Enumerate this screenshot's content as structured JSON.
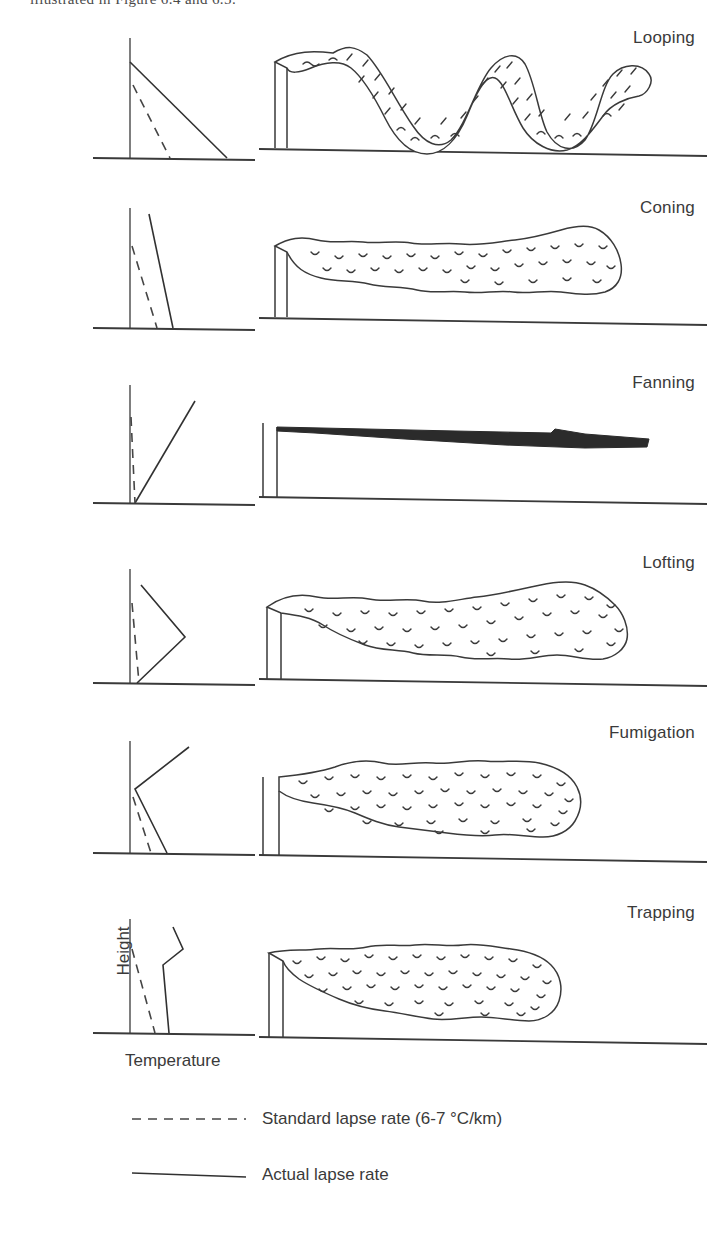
{
  "top_caption_fragment": "illustrated in Figure 6.4 and 6.5.",
  "axes": {
    "y_label": "Height",
    "x_label": "Temperature"
  },
  "legend": [
    {
      "style": "dashed",
      "label": "Standard lapse rate (6-7 °C/km)"
    },
    {
      "style": "solid",
      "label": "Actual lapse rate"
    }
  ],
  "panels": [
    {
      "label": "Looping",
      "stability": "strongly unstable / superadiabatic",
      "plume_type": "looping",
      "profile": {
        "actual_lapse_description": "steeply sloping to the right, lapse rate much greater than standard",
        "standard_lapse_description": "dashed line sloping moderately right"
      }
    },
    {
      "label": "Coning",
      "stability": "slightly unstable to neutral",
      "plume_type": "coning",
      "profile": {
        "actual_lapse_description": "nearly vertical, slightly steeper than standard",
        "standard_lapse_description": "dashed line sloping slightly right"
      }
    },
    {
      "label": "Fanning",
      "stability": "stable / inversion through full depth",
      "plume_type": "fanning",
      "profile": {
        "actual_lapse_description": "sloping up and to the right from the ground (inversion)",
        "standard_lapse_description": "dashed line sloping down to the right"
      }
    },
    {
      "label": "Lofting",
      "stability": "inversion below, unstable above",
      "plume_type": "lofting",
      "profile": {
        "actual_lapse_description": "inversion from ground to mid height, then lapse above (V pointing right)",
        "standard_lapse_description": "dashed line sloping slightly right"
      }
    },
    {
      "label": "Fumigation",
      "stability": "unstable below, inversion above",
      "plume_type": "fumigation",
      "profile": {
        "actual_lapse_description": "lapse near ground, inversion aloft (K shape)",
        "standard_lapse_description": "dashed line sloping slightly right"
      }
    },
    {
      "label": "Trapping",
      "stability": "inversions both above and below plume layer",
      "plume_type": "trapping",
      "profile": {
        "actual_lapse_description": "zigzag with inversion layers above and below a neutral layer",
        "standard_lapse_description": "dashed line sloping slightly right"
      }
    }
  ],
  "colors": {
    "line": "#313131",
    "plume_fill": "#ffffff",
    "fanning_plume_fill": "#2b2b2b",
    "background": "#ffffff"
  }
}
